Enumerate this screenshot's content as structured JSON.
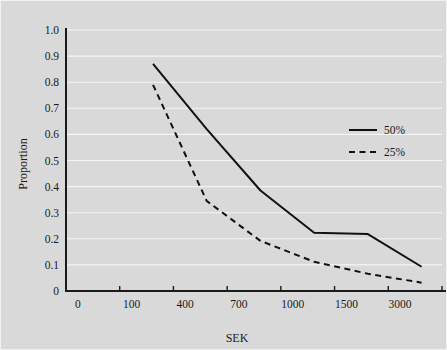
{
  "figure": {
    "background_color": "#d9d9d9",
    "plot_background_color": "#d9d9d9",
    "grid_color": "#f4f4f4",
    "axis_color": "#1a1a1a",
    "line_color": "#111111"
  },
  "chart_data": {
    "type": "line",
    "title": "",
    "subtitle": "",
    "xlabel": "SEK",
    "ylabel": "Proportion",
    "categories": [
      "0",
      "100",
      "400",
      "700",
      "1000",
      "1500",
      "3000"
    ],
    "x_tick_labels": [
      "0",
      "100",
      "400",
      "700",
      "1000",
      "1500",
      "3000"
    ],
    "y_tick_labels": [
      "0",
      "0.1",
      "0.2",
      "0.3",
      "0.4",
      "0.5",
      "0.6",
      "0.7",
      "0.8",
      "0.9",
      "1.0"
    ],
    "y_tick_values": [
      0,
      0.1,
      0.2,
      0.3,
      0.4,
      0.5,
      0.6,
      0.7,
      0.8,
      0.9,
      1.0
    ],
    "ylim": [
      0,
      1.0
    ],
    "grid": true,
    "grid_axis": "y",
    "legend_position": "right-middle",
    "series": [
      {
        "name": "50%",
        "style": "solid",
        "x": [
          "100",
          "400",
          "700",
          "1000",
          "1500",
          "3000"
        ],
        "values": [
          0.87,
          0.62,
          0.385,
          0.223,
          0.218,
          0.093
        ]
      },
      {
        "name": "25%",
        "style": "dashed",
        "x": [
          "100",
          "400",
          "700",
          "1000",
          "1500",
          "3000"
        ],
        "values": [
          0.79,
          0.345,
          0.192,
          0.112,
          0.066,
          0.032
        ]
      }
    ]
  },
  "legend": {
    "items": [
      {
        "label": "50%",
        "style": "solid"
      },
      {
        "label": "25%",
        "style": "dashed"
      }
    ]
  }
}
